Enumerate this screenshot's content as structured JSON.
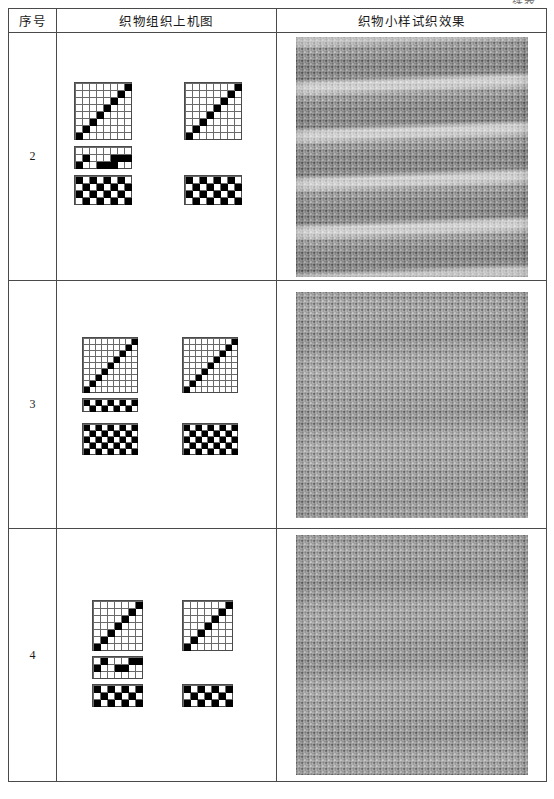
{
  "document": {
    "continued_label": "续表",
    "page_kind": "textbook-table"
  },
  "table": {
    "headers": [
      "序号",
      "织物组织上机图",
      "织物小样试织效果"
    ],
    "rows": [
      {
        "no": "2",
        "draft_caption": "织物组织上机图",
        "sample_caption": "织物小样试织效果",
        "draft": {
          "type": "weaving-draft",
          "unit": 7,
          "threading": {
            "label": "穿综图",
            "cols": 8,
            "rows": 8,
            "pattern": "straight-draw-ascending",
            "marks": [
              [
                0,
                7
              ],
              [
                1,
                6
              ],
              [
                2,
                5
              ],
              [
                3,
                4
              ],
              [
                4,
                3
              ],
              [
                5,
                2
              ],
              [
                6,
                1
              ],
              [
                7,
                0
              ]
            ]
          },
          "threading_right": {
            "label": "穿综图(右)",
            "cols": 8,
            "rows": 8,
            "pattern": "straight-draw-ascending",
            "marks": [
              [
                0,
                7
              ],
              [
                1,
                6
              ],
              [
                2,
                5
              ],
              [
                3,
                4
              ],
              [
                4,
                3
              ],
              [
                5,
                2
              ],
              [
                6,
                1
              ],
              [
                7,
                0
              ]
            ]
          },
          "tieup": {
            "label": "纹板图",
            "cols": 8,
            "rows": 3,
            "marks": [
              [
                1,
                1
              ],
              [
                5,
                1
              ],
              [
                6,
                1
              ],
              [
                7,
                1
              ],
              [
                0,
                2
              ],
              [
                3,
                2
              ],
              [
                4,
                2
              ],
              [
                5,
                2
              ]
            ]
          },
          "liftplan": {
            "label": "组织图",
            "cols": 8,
            "rows": 4,
            "pattern": "checker-2x1",
            "marks": [
              [
                0,
                0
              ],
              [
                2,
                0
              ],
              [
                4,
                0
              ],
              [
                6,
                0
              ],
              [
                1,
                1
              ],
              [
                3,
                1
              ],
              [
                5,
                1
              ],
              [
                7,
                1
              ],
              [
                0,
                2
              ],
              [
                2,
                2
              ],
              [
                4,
                2
              ],
              [
                6,
                2
              ],
              [
                1,
                3
              ],
              [
                3,
                3
              ],
              [
                5,
                3
              ],
              [
                7,
                3
              ]
            ]
          },
          "liftplan_right": {
            "label": "组织图(右)",
            "cols": 8,
            "rows": 4,
            "pattern": "checker-2x1",
            "marks": [
              [
                0,
                0
              ],
              [
                2,
                0
              ],
              [
                4,
                0
              ],
              [
                6,
                0
              ],
              [
                1,
                1
              ],
              [
                3,
                1
              ],
              [
                5,
                1
              ],
              [
                7,
                1
              ],
              [
                0,
                2
              ],
              [
                2,
                2
              ],
              [
                4,
                2
              ],
              [
                6,
                2
              ],
              [
                1,
                3
              ],
              [
                3,
                3
              ],
              [
                5,
                3
              ],
              [
                7,
                3
              ]
            ]
          }
        },
        "sample": {
          "texture": "horizontal-striped-plain-weave",
          "base_color": "#9b9b9b",
          "stripe_color": "#c9c9c9",
          "stripe_count": 5,
          "weave_pitch_px": 3
        }
      },
      {
        "no": "3",
        "draft": {
          "type": "weaving-draft",
          "unit": 6,
          "threading": {
            "label": "穿综图",
            "cols": 9,
            "rows": 9,
            "pattern": "straight-draw-ascending"
          },
          "threading_right": {
            "label": "穿综图(右)",
            "cols": 9,
            "rows": 9,
            "pattern": "straight-draw-ascending"
          },
          "tieup": {
            "label": "纹板图",
            "cols": 9,
            "rows": 2,
            "pattern": "alternating-checker"
          },
          "liftplan": {
            "label": "组织图",
            "cols": 9,
            "rows": 5,
            "pattern": "checker-2x1"
          },
          "liftplan_right": {
            "label": "组织图(右)",
            "cols": 9,
            "rows": 5,
            "pattern": "checker-2x1"
          }
        },
        "sample": {
          "texture": "uniform-mesh-plain-weave",
          "base_color": "#a2a2a2",
          "stripe_color": "#b4b4b4",
          "stripe_count": 0,
          "weave_pitch_px": 3
        }
      },
      {
        "no": "4",
        "draft": {
          "type": "weaving-draft",
          "unit": 7,
          "threading": {
            "label": "穿综图",
            "cols": 7,
            "rows": 7,
            "pattern": "straight-draw-ascending"
          },
          "threading_right": {
            "label": "穿综图(右)",
            "cols": 7,
            "rows": 7,
            "pattern": "straight-draw-ascending"
          },
          "tieup": {
            "label": "纹板图",
            "cols": 7,
            "rows": 3,
            "marks": [
              [
                1,
                0
              ],
              [
                5,
                0
              ],
              [
                6,
                0
              ],
              [
                0,
                1
              ],
              [
                3,
                1
              ],
              [
                4,
                1
              ]
            ]
          },
          "liftplan": {
            "label": "组织图",
            "cols": 7,
            "rows": 3,
            "pattern": "checker-2x1"
          },
          "liftplan_right": {
            "label": "组织图(右)",
            "cols": 7,
            "rows": 3,
            "pattern": "checker-2x1"
          }
        },
        "sample": {
          "texture": "dotted-mesh-plain-weave",
          "base_color": "#9e9e9e",
          "stripe_color": "#aeaeae",
          "stripe_count": 0,
          "weave_pitch_px": 3
        }
      }
    ]
  },
  "colors": {
    "rule": "#4a4a4a",
    "ink": "#000000",
    "paper": "#ffffff"
  }
}
